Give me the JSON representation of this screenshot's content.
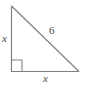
{
  "figure": {
    "type": "right-triangle-diagram",
    "background_color": "#ffffff",
    "stroke_color": "#808080",
    "label_color": "#4a4a4a",
    "labels": {
      "vertical_leg": "x",
      "horizontal_leg": "x",
      "hypotenuse": "6"
    },
    "geometry": {
      "apex": [
        11,
        6
      ],
      "right_angle_vertex": [
        11,
        71
      ],
      "bottom_right_vertex": [
        79,
        71
      ],
      "right_angle_marker_size": 11
    }
  }
}
